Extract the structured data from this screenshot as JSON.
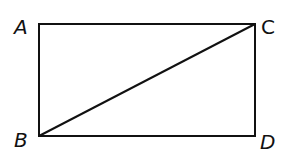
{
  "diagram": {
    "type": "rectangle-with-diagonal",
    "stroke_color": "#111111",
    "vertices": [
      {
        "label": "A",
        "x": 39,
        "y": 24,
        "label_x": 14,
        "label_y": 34
      },
      {
        "label": "C",
        "x": 255,
        "y": 24,
        "label_x": 261,
        "label_y": 34
      },
      {
        "label": "B",
        "x": 39,
        "y": 136,
        "label_x": 14,
        "label_y": 147
      },
      {
        "label": "D",
        "x": 255,
        "y": 136,
        "label_x": 260,
        "label_y": 149
      }
    ],
    "segments": [
      {
        "from": "A",
        "to": "C"
      },
      {
        "from": "C",
        "to": "D"
      },
      {
        "from": "D",
        "to": "B"
      },
      {
        "from": "B",
        "to": "A"
      },
      {
        "from": "B",
        "to": "C",
        "role": "diagonal"
      }
    ]
  }
}
